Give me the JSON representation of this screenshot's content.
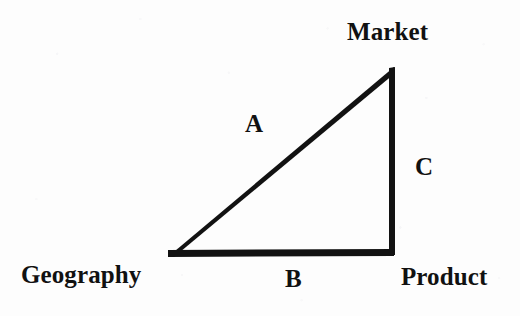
{
  "diagram": {
    "type": "right-triangle",
    "background_color": "#fdfdfd",
    "stroke_color": "#111111",
    "vertices": [
      {
        "id": "geography",
        "label": "Geography",
        "x": 169,
        "y": 253,
        "label_position": "bottom-left"
      },
      {
        "id": "market",
        "label": "Market",
        "x": 394,
        "y": 66,
        "label_position": "top-right"
      },
      {
        "id": "product",
        "label": "Product",
        "x": 392,
        "y": 253,
        "label_position": "bottom-right"
      }
    ],
    "edges": [
      {
        "id": "a",
        "label": "A",
        "from": "geography",
        "to": "market",
        "label_x": 253,
        "label_y": 125,
        "stroke_width": 6
      },
      {
        "id": "b",
        "label": "B",
        "from": "geography",
        "to": "product",
        "label_x": 293,
        "label_y": 280,
        "stroke_width": 6
      },
      {
        "id": "c",
        "label": "C",
        "from": "product",
        "to": "market",
        "label_x": 423,
        "label_y": 168,
        "stroke_width": 5
      }
    ]
  }
}
